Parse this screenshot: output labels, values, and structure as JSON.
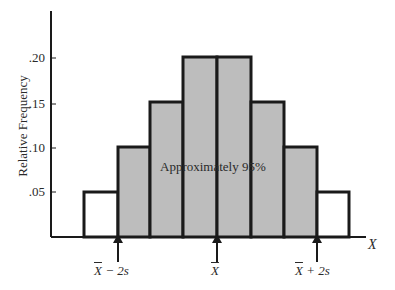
{
  "chart_data": {
    "type": "bar",
    "subtype": "histogram",
    "title": "",
    "xlabel": "X",
    "ylabel": "Relative Frequency",
    "ylim": [
      0,
      0.25
    ],
    "yticks": [
      ".05",
      ".10",
      ".15",
      ".20"
    ],
    "grid": false,
    "categories": [
      "1",
      "2",
      "3",
      "4",
      "5",
      "6",
      "7",
      "8"
    ],
    "values": [
      0.05,
      0.1,
      0.15,
      0.2,
      0.2,
      0.15,
      0.1,
      0.05
    ],
    "shaded": [
      false,
      true,
      true,
      true,
      true,
      true,
      true,
      false
    ],
    "annotation": "Approximately 95%",
    "markers": [
      {
        "bar": "X",
        "suffix": " − 2s"
      },
      {
        "bar": "X",
        "suffix": ""
      },
      {
        "bar": "X",
        "suffix": " + 2s"
      }
    ],
    "colors": {
      "fill": "#bdbdbd",
      "edge": "#1a1a1a",
      "background": "#ffffff"
    }
  },
  "labels": {
    "ylabel": "Relative Frequency",
    "xlabel": "X",
    "annotation": "Approximately 95%",
    "t20": ".20",
    "t15": ".15",
    "t10": ".10",
    "t05": ".05",
    "m1_bar": "X",
    "m1_rest": " − 2s",
    "m2_bar": "X",
    "m3_bar": "X",
    "m3_rest": " + 2s"
  }
}
